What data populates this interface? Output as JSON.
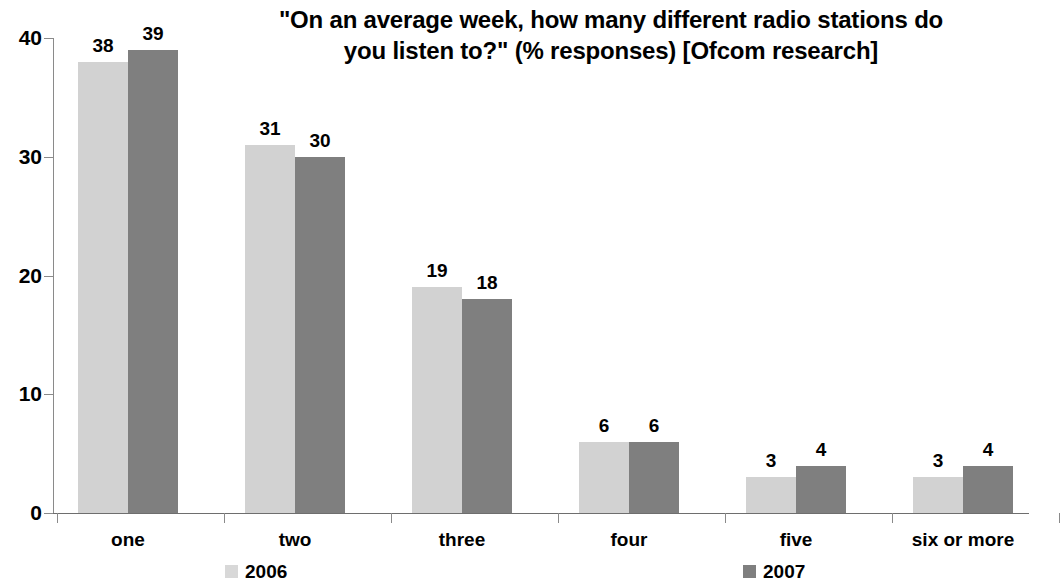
{
  "chart_data": {
    "type": "bar",
    "title": "\"On an average week, how many different radio stations do you listen to?\" (% responses) [Ofcom research]",
    "title_line1": "\"On an average week, how many different radio stations do",
    "title_line2": "you listen to?\" (% responses) [Ofcom research]",
    "categories": [
      "one",
      "two",
      "three",
      "four",
      "five",
      "six or more"
    ],
    "series": [
      {
        "name": "2006",
        "color": "#d2d2d2",
        "values": [
          38,
          31,
          19,
          6,
          3,
          3
        ]
      },
      {
        "name": "2007",
        "color": "#7f7f7f",
        "values": [
          39,
          30,
          18,
          6,
          4,
          4
        ]
      }
    ],
    "xlabel": "",
    "ylabel": "",
    "ylim": [
      0,
      40
    ],
    "yticks": [
      0,
      10,
      20,
      30,
      40
    ],
    "ytick_labels": [
      "0",
      "10",
      "20",
      "30",
      "40"
    ],
    "grid": false,
    "legend_position": "bottom",
    "value_labels_shown": true
  },
  "legend": {
    "items": [
      {
        "label": "2006",
        "swatch": "legend-swatch-2006"
      },
      {
        "label": "2007",
        "swatch": "legend-swatch-2007"
      }
    ]
  }
}
